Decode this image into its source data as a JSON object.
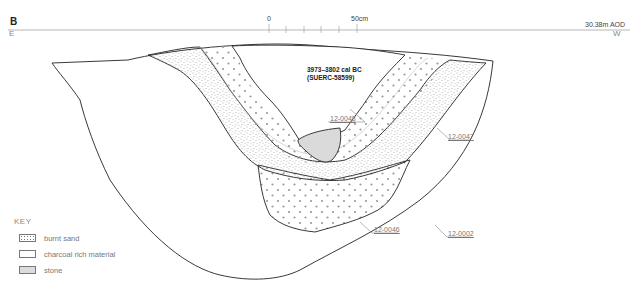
{
  "figure": {
    "section_label": "B",
    "direction_left": "E",
    "direction_right": "W",
    "datum": "30.38m AOD",
    "scale_bar": {
      "start_label": "0",
      "end_label": "50cm",
      "divisions": 5
    },
    "date_annotation": {
      "line1": "3973–3802 cal BC",
      "line2": "(SUERC-58599)"
    },
    "contexts": [
      {
        "id": "12-0048",
        "description": "upper fill"
      },
      {
        "id": "12-0047",
        "description": "burnt sand layer"
      },
      {
        "id": "12-0046",
        "description": "lower fill"
      },
      {
        "id": "12-0002",
        "description": "cut"
      }
    ],
    "key": {
      "title": "KEY",
      "items": [
        {
          "swatch": "burnt-sand",
          "label": "burnt sand"
        },
        {
          "swatch": "charcoal",
          "label": "charcoal rich material"
        },
        {
          "swatch": "stone",
          "label": "stone"
        }
      ]
    },
    "colors": {
      "line": "#222222",
      "stone_fill": "#dcdcdc",
      "dots": "#9a9a9a",
      "stipple": "#666666",
      "leader": "#888888"
    }
  }
}
